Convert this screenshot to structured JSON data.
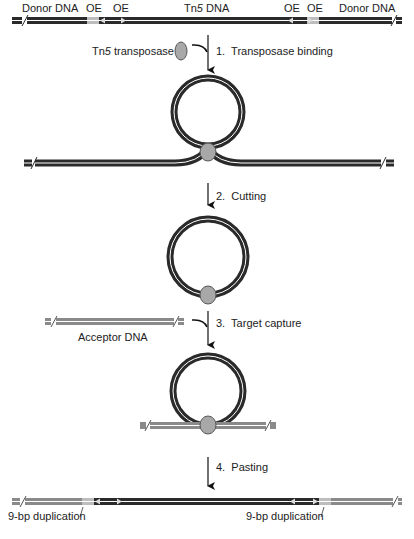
{
  "figure": {
    "top_labels": {
      "donor_left": "Donor DNA",
      "oe1": "OE",
      "oe2": "OE",
      "tn5_prefix": "Tn",
      "tn5_italic": "5",
      "tn5_suffix": " DNA",
      "oe3": "OE",
      "oe4": "OE",
      "donor_right": "Donor DNA"
    },
    "transposase_label_prefix": "Tn",
    "transposase_label_italic": "5",
    "transposase_label_suffix": " transposase",
    "steps": [
      {
        "number": "1.",
        "label": "Transposase binding"
      },
      {
        "number": "2.",
        "label": "Cutting"
      },
      {
        "number": "3.",
        "label": "Target capture"
      },
      {
        "number": "4.",
        "label": "Pasting"
      }
    ],
    "acceptor_label": "Acceptor DNA",
    "duplication_left": "9-bp duplication",
    "duplication_right": "9-bp duplication",
    "colors": {
      "donor_dna": "#2a2a2a",
      "acceptor_dna": "#8a8a8a",
      "oe_region": "#bdbdbd",
      "transposase": "#a8a8a8",
      "arrow": "#111111"
    }
  }
}
